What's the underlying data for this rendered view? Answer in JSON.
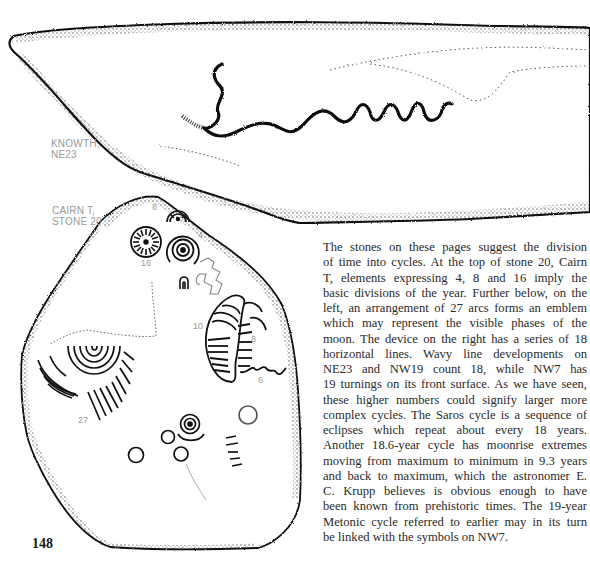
{
  "page": {
    "folio": "148",
    "captions": {
      "knowth": {
        "line1": "KNOWTH,",
        "line2": "NE23"
      },
      "cairn": {
        "line1": "CAIRN T,",
        "line2": "STONE 20"
      }
    },
    "stone_labels": {
      "eight_top": "8",
      "four": "4",
      "sixteen": "16",
      "ten": "10",
      "eight_right": "8",
      "six": "6",
      "twentyseven": "27"
    },
    "paragraph_lines": [
      "The stones on these pages suggest the division",
      "of time into cycles. At the top of stone 20, Cairn",
      "T, elements expressing 4, 8 and 16 imply the",
      "basic divisions of the year. Further below, on the",
      "left, an arrangement of 27 arcs forms an emblem",
      "which may represent the visible phases of the",
      "moon. The device on the right has a series of 18",
      "horizontal lines. Wavy line developments on",
      "NE23 and NW19 count 18, while NW7 has",
      "19 turnings on its front surface. As we have seen,",
      "these higher numbers could signify larger more",
      "complex cycles. The Saros cycle is a sequence of",
      "eclipses which repeat about every 18 years.",
      "Another 18.6-year cycle has moonrise extremes",
      "moving from maximum to minimum in 9.3 years",
      "and back to maximum, which the astronomer E.",
      "C. Krupp believes is obvious enough to have",
      "been known from prehistoric times. The 19-year",
      "Metonic cycle referred to earlier may in its turn",
      "be linked with the symbols on NW7."
    ]
  }
}
